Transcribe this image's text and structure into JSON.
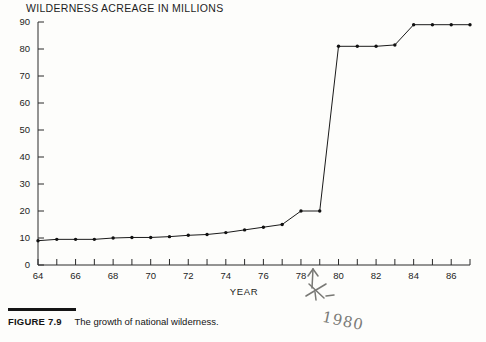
{
  "figure": {
    "label": "FIGURE 7.9",
    "caption": "The growth of national wilderness."
  },
  "annotation": {
    "handwritten_year": "1980",
    "arrow_icon": "up-arrow-pencil-mark",
    "arrow_points_to_year": 79
  },
  "colors": {
    "line": "#1a1a1a",
    "axis": "#2a2a2a",
    "background": "#fdfdfb",
    "handwriting": "#6a6a66"
  },
  "chart_data": {
    "type": "line",
    "title": "WILDERNESS ACREAGE IN MILLIONS",
    "subtitle": "",
    "xlabel": "YEAR",
    "ylabel": "",
    "xlim": [
      64,
      87
    ],
    "ylim": [
      0,
      90
    ],
    "grid": false,
    "legend_position": "none",
    "markers": true,
    "y_ticks": [
      0,
      10,
      20,
      30,
      40,
      50,
      60,
      70,
      80,
      90
    ],
    "y_tick_labels": [
      "0",
      "10",
      "20",
      "30",
      "40",
      "50",
      "60",
      "70",
      "80",
      "90"
    ],
    "x_ticks": [
      64,
      65,
      66,
      67,
      68,
      69,
      70,
      71,
      72,
      73,
      74,
      75,
      76,
      77,
      78,
      79,
      80,
      81,
      82,
      83,
      84,
      85,
      86,
      87
    ],
    "x_tick_labels": [
      "64",
      "",
      "66",
      "",
      "68",
      "",
      "70",
      "",
      "72",
      "",
      "74",
      "",
      "76",
      "",
      "78",
      "",
      "80",
      "",
      "82",
      "",
      "84",
      "",
      "86",
      ""
    ],
    "x": [
      64,
      65,
      66,
      67,
      68,
      69,
      70,
      71,
      72,
      73,
      74,
      75,
      76,
      77,
      78,
      79,
      80,
      81,
      82,
      83,
      84,
      85,
      86,
      87
    ],
    "values": [
      9,
      9.5,
      9.5,
      9.5,
      10,
      10.2,
      10.2,
      10.5,
      11,
      11.3,
      12,
      13,
      14,
      15,
      20,
      20,
      81,
      81,
      81,
      81.5,
      89,
      89,
      89,
      89
    ],
    "series": [
      {
        "name": "Wilderness acreage",
        "values": [
          9,
          9.5,
          9.5,
          9.5,
          10,
          10.2,
          10.2,
          10.5,
          11,
          11.3,
          12,
          13,
          14,
          15,
          20,
          20,
          81,
          81,
          81,
          81.5,
          89,
          89,
          89,
          89
        ]
      }
    ],
    "annotations": [
      {
        "text": "1980",
        "x": 79,
        "note": "handwritten pencil arrow and year"
      }
    ]
  }
}
